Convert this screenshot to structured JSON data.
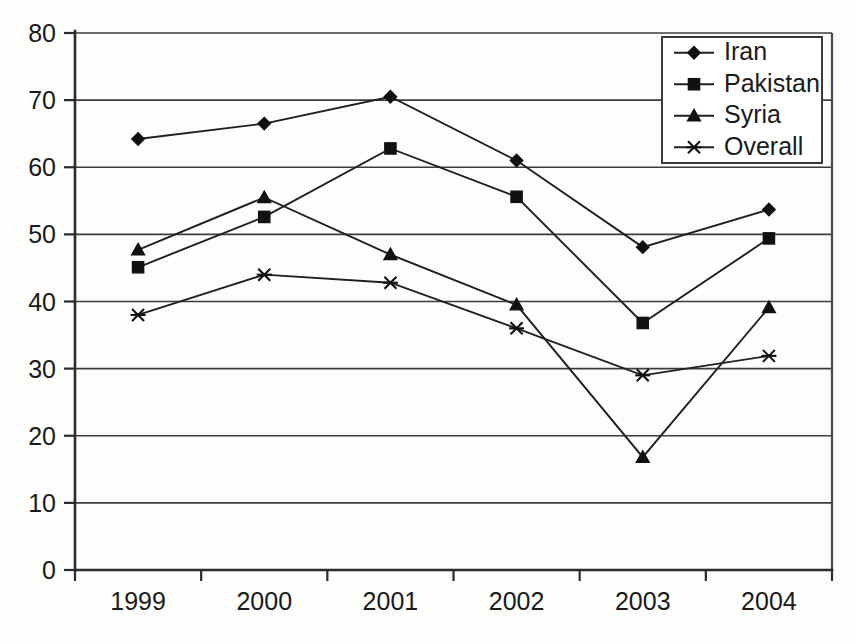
{
  "chart_data": {
    "type": "line",
    "title": "",
    "subtitle": "",
    "xlabel": "",
    "ylabel": "",
    "categories": [
      "1999",
      "2000",
      "2001",
      "2002",
      "2003",
      "2004"
    ],
    "x": [
      1999,
      2000,
      2001,
      2002,
      2003,
      2004
    ],
    "ylim": [
      0,
      80
    ],
    "yticks": [
      0,
      10,
      20,
      30,
      40,
      50,
      60,
      70,
      80
    ],
    "ytick_labels": [
      "0",
      "10",
      "20",
      "30",
      "40",
      "50",
      "60",
      "70",
      "80"
    ],
    "grid": "horizontal",
    "legend_position": "top-right",
    "series": [
      {
        "name": "Iran",
        "marker": "diamond",
        "values": [
          64.2,
          66.5,
          70.5,
          61.0,
          48.1,
          53.7
        ]
      },
      {
        "name": "Pakistan",
        "marker": "square",
        "values": [
          45.1,
          52.6,
          62.8,
          55.6,
          36.8,
          49.4
        ]
      },
      {
        "name": "Syria",
        "marker": "triangle",
        "values": [
          47.7,
          55.5,
          47.0,
          39.5,
          16.8,
          39.1
        ]
      },
      {
        "name": "Overall",
        "marker": "cross",
        "values": [
          38.0,
          44.0,
          42.8,
          36.0,
          29.0,
          31.9
        ]
      }
    ],
    "colors": {
      "line": "#1f1f1f",
      "marker": "#111111",
      "grid": "#3c3c3c",
      "axis": "#2b2b2b",
      "background": "#fdfdfc",
      "legend_border": "#3a3a3a"
    },
    "annotations": []
  },
  "legend": {
    "entries": [
      {
        "label": "Iran",
        "marker": "diamond-icon"
      },
      {
        "label": "Pakistan",
        "marker": "square-icon"
      },
      {
        "label": "Syria",
        "marker": "triangle-icon"
      },
      {
        "label": "Overall",
        "marker": "cross-icon"
      }
    ]
  }
}
